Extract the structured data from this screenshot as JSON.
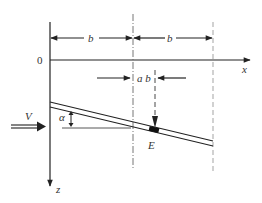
{
  "diagram": {
    "type": "geometry/physics schematic",
    "origin_label": "0",
    "x_axis_label": "x",
    "z_axis_label": "z",
    "velocity_label": "V",
    "angle_label": "α",
    "point_label": "E",
    "dimensions": {
      "left_span_label": "b",
      "right_span_label": "b",
      "offset_label": "a b"
    },
    "colors": {
      "line": "#222222",
      "dash_line": "#888888",
      "background": "#ffffff"
    }
  }
}
